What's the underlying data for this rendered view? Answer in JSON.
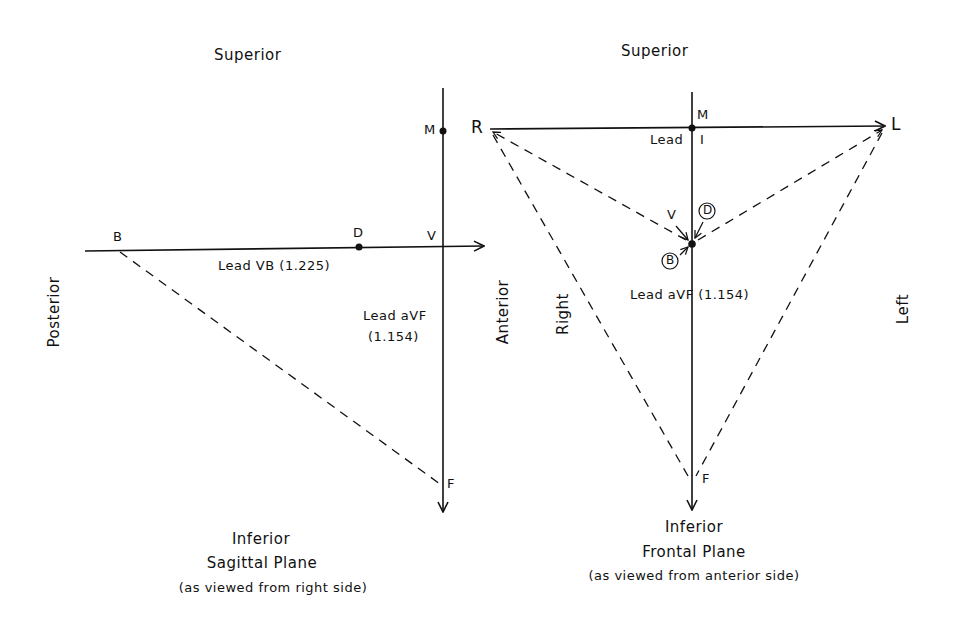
{
  "sagittal": {
    "superior": "Superior",
    "inferior": "Inferior",
    "title": "Sagittal Plane",
    "subtitle": "(as viewed from right side)",
    "posterior": "Posterior",
    "anterior": "Anterior",
    "points": {
      "M": "M",
      "B": "B",
      "D": "D",
      "V": "V",
      "F": "F"
    },
    "lead_vb": "Lead VB (1.225)",
    "lead_avf_1": "Lead aVF",
    "lead_avf_2": "(1.154)"
  },
  "frontal": {
    "superior": "Superior",
    "inferior": "Inferior",
    "title": "Frontal Plane",
    "subtitle": "(as viewed from anterior side)",
    "right": "Right",
    "left": "Left",
    "points": {
      "R": "R",
      "L": "L",
      "M": "M",
      "V": "V",
      "F": "F",
      "D_circled": "D",
      "B_circled": "B"
    },
    "lead_i_1": "Lead",
    "lead_i_2": "I",
    "lead_avf": "Lead aVF (1.154)"
  }
}
